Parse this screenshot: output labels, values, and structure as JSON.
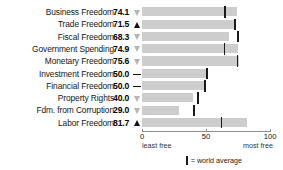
{
  "chart_data": {
    "type": "bar",
    "title": "",
    "xlabel": "",
    "ylabel": "",
    "xlim": [
      0,
      100
    ],
    "grid": false,
    "orientation": "horizontal",
    "categories": [
      "Business Freedom",
      "Trade Freedom",
      "Fiscal Freedom",
      "Government Spending",
      "Monetary Freedom",
      "Investment Freedom",
      "Financial Freedom",
      "Property Rights",
      "Fdm. from Corruption",
      "Labor Freedom"
    ],
    "values": [
      74.1,
      71.5,
      68.3,
      74.9,
      75.6,
      50.0,
      50.0,
      40.0,
      29.0,
      81.7
    ],
    "trends": [
      "down",
      "up",
      "down",
      "down",
      "down",
      "flat",
      "flat",
      "down",
      "down",
      "up"
    ],
    "world_average": [
      65.0,
      72.5,
      75.0,
      64.5,
      74.5,
      50.5,
      49.0,
      43.5,
      40.5,
      62.0
    ],
    "series": [
      {
        "name": "Score",
        "values": [
          74.1,
          71.5,
          68.3,
          74.9,
          75.6,
          50.0,
          50.0,
          40.0,
          29.0,
          81.7
        ]
      },
      {
        "name": "World average",
        "values": [
          65.0,
          72.5,
          75.0,
          64.5,
          74.5,
          50.5,
          49.0,
          43.5,
          40.5,
          62.0
        ]
      }
    ],
    "axis_ticks": [
      {
        "value": 0,
        "label": "0"
      },
      {
        "value": 50,
        "label": "50"
      },
      {
        "value": 100,
        "label": "100"
      }
    ],
    "axis_end_labels": {
      "left": "least free",
      "right": "most free"
    },
    "legend": {
      "position": "bottom-center",
      "marker": "world-average-tick",
      "text": "= world average"
    },
    "colors": {
      "bar": "#cdcdcd",
      "average_tick": "#1a1a1a",
      "trend_up": "#111111",
      "trend_down": "#b5b5b5",
      "trend_flat": "#111111",
      "axis": "#8d8d8d",
      "text": "#111111",
      "background": "#ffffff"
    }
  }
}
